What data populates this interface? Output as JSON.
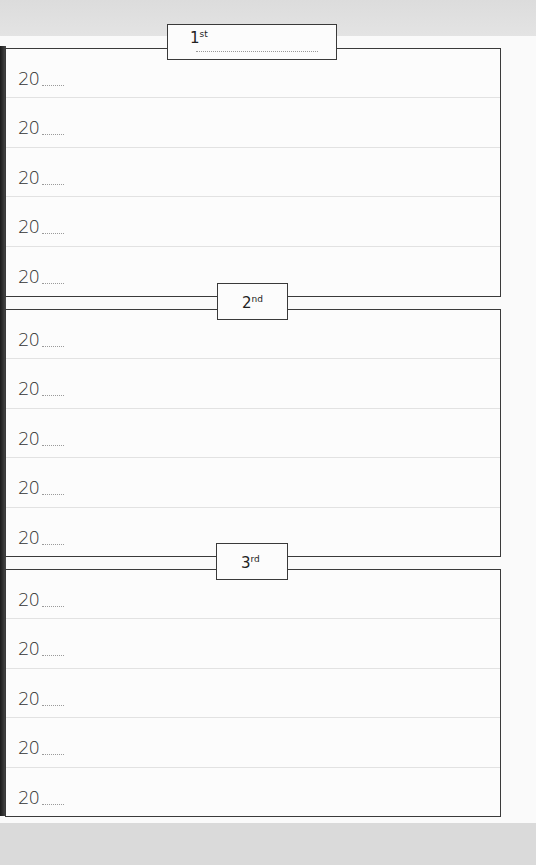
{
  "sections": [
    {
      "label_num": "1",
      "label_suffix": "st",
      "has_name_line": true,
      "rows": [
        {
          "year_prefix": "20"
        },
        {
          "year_prefix": "20"
        },
        {
          "year_prefix": "20"
        },
        {
          "year_prefix": "20"
        },
        {
          "year_prefix": "20"
        }
      ]
    },
    {
      "label_num": "2",
      "label_suffix": "nd",
      "has_name_line": false,
      "rows": [
        {
          "year_prefix": "20"
        },
        {
          "year_prefix": "20"
        },
        {
          "year_prefix": "20"
        },
        {
          "year_prefix": "20"
        },
        {
          "year_prefix": "20"
        }
      ]
    },
    {
      "label_num": "3",
      "label_suffix": "rd",
      "has_name_line": false,
      "rows": [
        {
          "year_prefix": "20"
        },
        {
          "year_prefix": "20"
        },
        {
          "year_prefix": "20"
        },
        {
          "year_prefix": "20"
        },
        {
          "year_prefix": "20"
        }
      ]
    }
  ],
  "colors": {
    "border": "#3a3a3a",
    "row_divider": "#e2e2e2",
    "page": "#fafafa",
    "background": "#d9d9d9"
  }
}
